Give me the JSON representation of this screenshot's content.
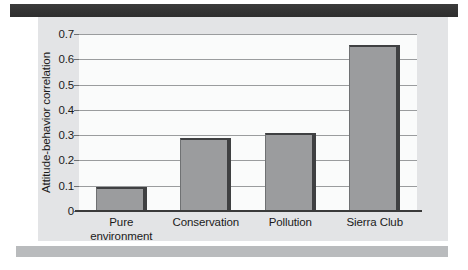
{
  "chart_data": {
    "type": "bar",
    "title": "",
    "xlabel": "",
    "ylabel": "Attitude-behavior correlation",
    "categories": [
      "Pure environment",
      "Conservation",
      "Pollution",
      "Sierra Club"
    ],
    "category_lines": [
      [
        "Pure",
        "environment"
      ],
      [
        "Conservation"
      ],
      [
        "Pollution"
      ],
      [
        "Sierra Club"
      ]
    ],
    "values": [
      0.095,
      0.29,
      0.31,
      0.655
    ],
    "ylim": [
      0,
      0.7
    ],
    "ytick_labels": [
      "0.7",
      "0.6",
      "0.5",
      "0.4",
      "0.3",
      "0.2",
      "0.1",
      "0"
    ],
    "ytick_values": [
      0.7,
      0.6,
      0.5,
      0.4,
      0.3,
      0.2,
      0.1,
      0
    ],
    "grid": true,
    "legend": "none",
    "bar_color": "#9b9c9e",
    "bar_edge_color": "#3f4042",
    "plot_background": "#fafbfb",
    "figure_background": "#e3e4e6",
    "gridline_color": "#9a9c9e",
    "axis_color": "#3a3a3a"
  }
}
